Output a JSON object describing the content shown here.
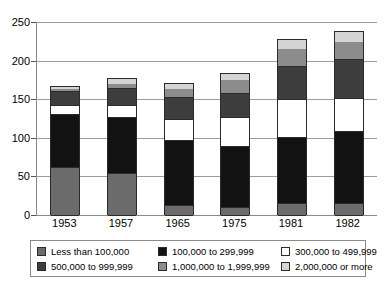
{
  "chart_data": {
    "type": "bar",
    "subtype": "stacked-bar",
    "title": "",
    "subtitle": "",
    "xlabel": "",
    "ylabel": "",
    "ylim": [
      0,
      250
    ],
    "y_ticks": [
      0,
      50,
      100,
      150,
      200,
      250
    ],
    "y_tick_labels": [
      "0",
      "50",
      "100",
      "150",
      "200",
      "250"
    ],
    "grid": true,
    "grid_axis": "y",
    "legend_position": "bottom",
    "categories": [
      "1953",
      "1957",
      "1965",
      "1975",
      "1981",
      "1982"
    ],
    "series": [
      {
        "name": "Less than 100,000",
        "color": "#6b6b6b",
        "values": [
          62,
          54,
          13,
          10,
          15,
          16
        ]
      },
      {
        "name": "100,000 to 299,999",
        "color": "#121212",
        "values": [
          69,
          73,
          84,
          80,
          86,
          93
        ]
      },
      {
        "name": "300,000 to 499,999",
        "color": "#ffffff",
        "values": [
          11,
          15,
          27,
          37,
          49,
          43
        ]
      },
      {
        "name": "500,000 to 999,999",
        "color": "#3d3d3d",
        "values": [
          18,
          22,
          29,
          31,
          43,
          50
        ]
      },
      {
        "name": "1,000,000 to 1,999,999",
        "color": "#8c8c8c",
        "values": [
          4,
          7,
          11,
          18,
          23,
          24
        ]
      },
      {
        "name": "2,000,000 or more",
        "color": "#d4d4d4",
        "values": [
          3,
          6,
          7,
          8,
          12,
          13
        ]
      }
    ],
    "totals": [
      167,
      177,
      171,
      184,
      228,
      239
    ]
  },
  "axis": {
    "y_labels": [
      "250",
      "200",
      "150",
      "100",
      "50",
      "0"
    ],
    "x_labels": [
      "1953",
      "1957",
      "1965",
      "1975",
      "1981",
      "1982"
    ]
  },
  "legend": {
    "items": [
      {
        "label": "Less than 100,000",
        "color": "#6b6b6b"
      },
      {
        "label": "100,000 to 299,999",
        "color": "#121212"
      },
      {
        "label": "300,000 to 499,999",
        "color": "#ffffff"
      },
      {
        "label": "500,000 to 999,999",
        "color": "#3d3d3d"
      },
      {
        "label": "1,000,000 to 1,999,999",
        "color": "#8c8c8c"
      },
      {
        "label": "2,000,000 or more",
        "color": "#d4d4d4"
      }
    ]
  }
}
